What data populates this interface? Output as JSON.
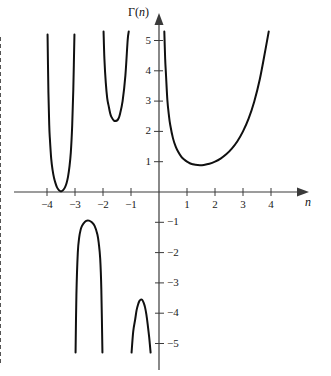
{
  "figure": {
    "title": "",
    "y_axis_label": "Γ(n)",
    "x_axis_label": "n",
    "axis_color": "#3a3a3a",
    "curve_color": "#101010",
    "asymptote_color": "#4a4a4a",
    "background": "#ffffff"
  },
  "axes": {
    "x_ticks": [
      {
        "value": -4,
        "label": "−4"
      },
      {
        "value": -3,
        "label": "−3"
      },
      {
        "value": -2,
        "label": "−2"
      },
      {
        "value": -1,
        "label": "−1"
      },
      {
        "value": 1,
        "label": "1"
      },
      {
        "value": 2,
        "label": "2"
      },
      {
        "value": 3,
        "label": "3"
      },
      {
        "value": 4,
        "label": "4"
      }
    ],
    "y_ticks": [
      {
        "value": 5,
        "label": "5"
      },
      {
        "value": 4,
        "label": "4"
      },
      {
        "value": 3,
        "label": "3"
      },
      {
        "value": 2,
        "label": "2"
      },
      {
        "value": 1,
        "label": "1"
      },
      {
        "value": -1,
        "label": "−1"
      },
      {
        "value": -2,
        "label": "−2"
      },
      {
        "value": -3,
        "label": "−3"
      },
      {
        "value": -4,
        "label": "−4"
      },
      {
        "value": -5,
        "label": "−5"
      }
    ],
    "xlim": [
      -4.55,
      4.6
    ],
    "ylim": [
      -5.35,
      5.35
    ]
  },
  "chart_data": {
    "type": "line",
    "title": "",
    "xlabel": "n",
    "ylabel": "Γ(n)",
    "xlim": [
      -4.55,
      4.6
    ],
    "ylim": [
      -5.35,
      5.35
    ],
    "grid": false,
    "legend": null,
    "function": "Gamma(n)",
    "asymptotes": [
      {
        "x": -4,
        "style": "dashed"
      },
      {
        "x": -3,
        "style": "dashed"
      },
      {
        "x": -2,
        "style": "dashed"
      },
      {
        "x": -1,
        "style": "dashed"
      },
      {
        "x": 0,
        "style": "axis"
      }
    ],
    "series": [
      {
        "name": "branch -4..-3",
        "x_range": [
          -3.98,
          -3.02
        ],
        "points": [
          [
            -3.98,
            5.2
          ],
          [
            -3.95,
            3.3
          ],
          [
            -3.92,
            2.2
          ],
          [
            -3.9,
            1.8
          ],
          [
            -3.85,
            1.1
          ],
          [
            -3.8,
            0.72
          ],
          [
            -3.75,
            0.47
          ],
          [
            -3.7,
            0.3
          ],
          [
            -3.65,
            0.17
          ],
          [
            -3.6,
            0.09
          ],
          [
            -3.55,
            0.04
          ],
          [
            -3.5,
            0.02
          ],
          [
            -3.45,
            0.04
          ],
          [
            -3.4,
            0.09
          ],
          [
            -3.35,
            0.17
          ],
          [
            -3.3,
            0.3
          ],
          [
            -3.25,
            0.5
          ],
          [
            -3.2,
            0.82
          ],
          [
            -3.15,
            1.3
          ],
          [
            -3.1,
            2.2
          ],
          [
            -3.06,
            3.4
          ],
          [
            -3.02,
            5.2
          ]
        ]
      },
      {
        "name": "branch -3..-2",
        "x_range": [
          -2.98,
          -2.02
        ],
        "points": [
          [
            -2.98,
            -5.3
          ],
          [
            -2.95,
            -3.4
          ],
          [
            -2.9,
            -2.0
          ],
          [
            -2.85,
            -1.5
          ],
          [
            -2.8,
            -1.25
          ],
          [
            -2.75,
            -1.12
          ],
          [
            -2.7,
            -1.04
          ],
          [
            -2.6,
            -0.95
          ],
          [
            -2.5,
            -0.945
          ],
          [
            -2.4,
            -1.0
          ],
          [
            -2.3,
            -1.12
          ],
          [
            -2.2,
            -1.4
          ],
          [
            -2.15,
            -1.7
          ],
          [
            -2.1,
            -2.2
          ],
          [
            -2.06,
            -3.2
          ],
          [
            -2.02,
            -5.3
          ]
        ]
      },
      {
        "name": "branch -2..-1",
        "x_range": [
          -1.98,
          -1.02
        ],
        "points": [
          [
            -1.98,
            5.3
          ],
          [
            -1.95,
            4.4
          ],
          [
            -1.9,
            3.6
          ],
          [
            -1.85,
            3.1
          ],
          [
            -1.8,
            2.85
          ],
          [
            -1.75,
            2.62
          ],
          [
            -1.7,
            2.48
          ],
          [
            -1.6,
            2.35
          ],
          [
            -1.5,
            2.36
          ],
          [
            -1.45,
            2.42
          ],
          [
            -1.4,
            2.55
          ],
          [
            -1.3,
            3.0
          ],
          [
            -1.2,
            3.85
          ],
          [
            -1.12,
            5.0
          ],
          [
            -1.08,
            5.3
          ]
        ]
      },
      {
        "name": "branch -1..0",
        "x_range": [
          -0.98,
          -0.12
        ],
        "points": [
          [
            -0.98,
            -5.3
          ],
          [
            -0.92,
            -4.6
          ],
          [
            -0.85,
            -4.2
          ],
          [
            -0.8,
            -3.9
          ],
          [
            -0.75,
            -3.72
          ],
          [
            -0.7,
            -3.6
          ],
          [
            -0.65,
            -3.55
          ],
          [
            -0.6,
            -3.56
          ],
          [
            -0.55,
            -3.65
          ],
          [
            -0.5,
            -3.8
          ],
          [
            -0.45,
            -4.05
          ],
          [
            -0.4,
            -4.4
          ],
          [
            -0.35,
            -4.8
          ],
          [
            -0.3,
            -5.3
          ]
        ]
      },
      {
        "name": "branch 0..inf",
        "x_range": [
          0.19,
          3.92
        ],
        "points": [
          [
            0.19,
            5.3
          ],
          [
            0.22,
            4.4
          ],
          [
            0.25,
            3.86
          ],
          [
            0.3,
            3.02
          ],
          [
            0.35,
            2.56
          ],
          [
            0.4,
            2.22
          ],
          [
            0.5,
            1.77
          ],
          [
            0.6,
            1.49
          ],
          [
            0.7,
            1.3
          ],
          [
            0.8,
            1.16
          ],
          [
            0.9,
            1.07
          ],
          [
            1.0,
            1.0
          ],
          [
            1.1,
            0.95
          ],
          [
            1.2,
            0.918
          ],
          [
            1.3,
            0.897
          ],
          [
            1.4616,
            0.8856
          ],
          [
            1.6,
            0.894
          ],
          [
            1.8,
            0.931
          ],
          [
            2.0,
            1.0
          ],
          [
            2.2,
            1.102
          ],
          [
            2.4,
            1.242
          ],
          [
            2.6,
            1.43
          ],
          [
            2.8,
            1.676
          ],
          [
            3.0,
            2.0
          ],
          [
            3.2,
            2.42
          ],
          [
            3.4,
            2.98
          ],
          [
            3.6,
            3.72
          ],
          [
            3.8,
            4.69
          ],
          [
            3.92,
            5.3
          ]
        ]
      }
    ]
  }
}
